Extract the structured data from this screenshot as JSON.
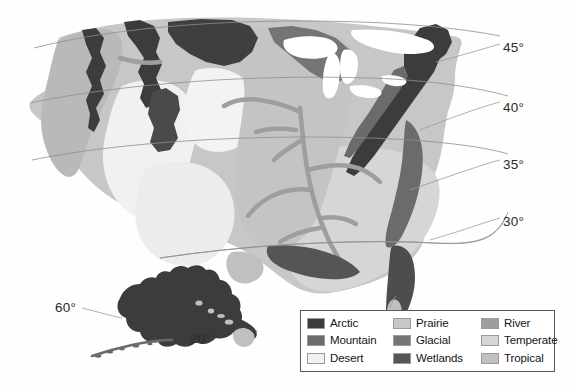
{
  "figure": {
    "background_color": "#fefefe"
  },
  "map": {
    "name": "united-states-climate-map",
    "regions_shown": [
      "Continental United States",
      "Alaska",
      "Hawaii"
    ],
    "water_color": "#ffffff",
    "outline_color": "#9b9b9b"
  },
  "latitude_labels": [
    {
      "id": "lat-45",
      "text": "45°",
      "left": 503,
      "top": 40
    },
    {
      "id": "lat-40",
      "text": "40°",
      "left": 503,
      "top": 100
    },
    {
      "id": "lat-35",
      "text": "35°",
      "left": 503,
      "top": 157
    },
    {
      "id": "lat-30",
      "text": "30°",
      "left": 503,
      "top": 214
    },
    {
      "id": "lat-60",
      "text": "60°",
      "left": 55,
      "top": 300
    },
    {
      "id": "lat-20",
      "text": "20°",
      "left": 190,
      "top": 331
    }
  ],
  "legend": {
    "border_color": "#585858",
    "background_color": "#ffffff",
    "columns": [
      {
        "id": "legend-column-1",
        "entries": [
          {
            "id": "legend-item-arctic",
            "label": "Arctic",
            "color": "#3c3c3c"
          },
          {
            "id": "legend-item-mountain",
            "label": "Mountain",
            "color": "#6b6b6b"
          },
          {
            "id": "legend-item-desert",
            "label": "Desert",
            "color": "#f1f1ef"
          }
        ]
      },
      {
        "id": "legend-column-2",
        "entries": [
          {
            "id": "legend-item-prairie",
            "label": "Prairie",
            "color": "#c7c7c5"
          },
          {
            "id": "legend-item-glacial",
            "label": "Glacial",
            "color": "#757575"
          },
          {
            "id": "legend-item-wetlands",
            "label": "Wetlands",
            "color": "#555555"
          }
        ]
      },
      {
        "id": "legend-column-3",
        "entries": [
          {
            "id": "legend-item-river",
            "label": "River",
            "color": "#9e9e9e"
          },
          {
            "id": "legend-item-temperate",
            "label": "Temperate",
            "color": "#d6d6d4"
          },
          {
            "id": "legend-item-tropical",
            "label": "Tropical",
            "color": "#c0c0be"
          }
        ]
      }
    ]
  },
  "palette": {
    "arctic": "#3c3c3c",
    "mountain": "#6b6b6b",
    "desert": "#f1f1ef",
    "prairie": "#c7c7c5",
    "glacial": "#757575",
    "wetlands": "#555555",
    "river": "#9e9e9e",
    "temperate": "#d6d6d4",
    "tropical": "#c0c0be",
    "water": "#ffffff",
    "graticule": "#8e8e8e",
    "leader_line": "#9b9b9b"
  }
}
